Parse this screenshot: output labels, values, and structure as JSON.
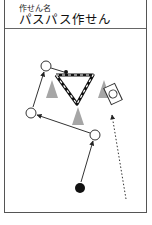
{
  "card": {
    "label": "作せん名",
    "title": "パスパス作せん"
  },
  "diagram": {
    "players_open": [
      {
        "id": "p1",
        "x": 46,
        "y": 66
      },
      {
        "id": "p2",
        "x": 31,
        "y": 113
      },
      {
        "id": "p3",
        "x": 95,
        "y": 135
      }
    ],
    "player_filled": {
      "id": "start",
      "x": 80,
      "y": 188
    },
    "cones": [
      {
        "x": 52,
        "y": 91
      },
      {
        "x": 104,
        "y": 91
      },
      {
        "x": 78,
        "y": 118
      }
    ],
    "colors": {
      "line": "#222222",
      "cone": "#a6a6a6",
      "border": "#555555"
    }
  }
}
